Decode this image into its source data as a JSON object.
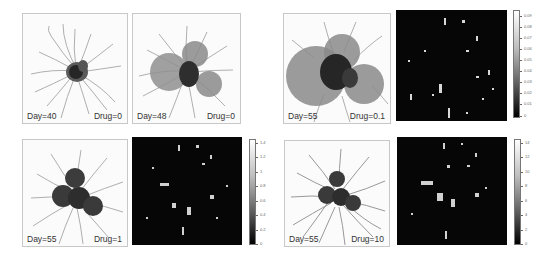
{
  "figure": {
    "panels": [
      {
        "id": "a",
        "type": "simulation",
        "day_label": "Day=40",
        "drug_label": "Drug=0",
        "x": 22,
        "y": 13,
        "w": 106,
        "h": 111,
        "tumour": "small"
      },
      {
        "id": "b",
        "type": "simulation",
        "day_label": "Day=48",
        "drug_label": "Drug=0",
        "x": 132,
        "y": 13,
        "w": 109,
        "h": 111,
        "tumour": "medium"
      },
      {
        "id": "c",
        "type": "simulation",
        "day_label": "Day=55",
        "drug_label": "Drug=0.1",
        "x": 283,
        "y": 13,
        "w": 108,
        "h": 111,
        "tumour": "large"
      },
      {
        "id": "c_map",
        "type": "concentration_map",
        "x": 396,
        "y": 10,
        "w": 111,
        "h": 111,
        "colorbar": {
          "ticks": [
            "0.09",
            "0.08",
            "0.07",
            "0.06",
            "0.05",
            "0.04",
            "0.03",
            "0.02",
            "0.01",
            "0"
          ],
          "min": 0,
          "max": 0.09
        }
      },
      {
        "id": "d",
        "type": "simulation",
        "day_label": "Day=55",
        "drug_label": "Drug=1",
        "x": 22,
        "y": 139,
        "w": 106,
        "h": 108,
        "tumour": "clustered"
      },
      {
        "id": "d_map",
        "type": "concentration_map",
        "x": 132,
        "y": 137,
        "w": 110,
        "h": 108,
        "colorbar": {
          "ticks": [
            "1.4",
            "1.2",
            "1",
            "0.8",
            "0.6",
            "0.4",
            "0.2",
            "0"
          ],
          "min": 0,
          "max": 1.4
        }
      },
      {
        "id": "e",
        "type": "simulation",
        "day_label": "Day=55",
        "drug_label": "Drug=10",
        "x": 284,
        "y": 140,
        "w": 106,
        "h": 107,
        "tumour": "clustered-small"
      },
      {
        "id": "e_map",
        "type": "concentration_map",
        "x": 397,
        "y": 137,
        "w": 110,
        "h": 108,
        "colorbar": {
          "ticks": [
            "14",
            "12",
            "10",
            "8",
            "6",
            "4",
            "2",
            "0"
          ],
          "min": 0,
          "max": 14
        }
      }
    ],
    "colors": {
      "background": "#ffffff",
      "map_background": "#060606",
      "vessel": "#8c8c8c",
      "tumour_core": "#2a2a2a",
      "tumour_halo": "#9a9a9a"
    }
  }
}
